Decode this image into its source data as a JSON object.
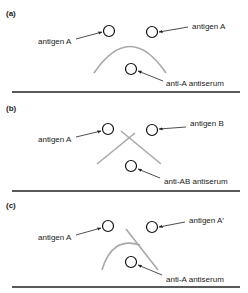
{
  "panels": [
    {
      "id": "a",
      "label": "(a)",
      "left_well": "antigen A",
      "right_well": "antigen A",
      "bottom_well": "anti-A antiserum",
      "precipitin_pattern": "continuous arc (identity)"
    },
    {
      "id": "b",
      "label": "(b)",
      "left_well": "antigen A",
      "right_well": "antigen B",
      "bottom_well": "anti-AB antiserum",
      "precipitin_pattern": "crossed lines (non-identity)"
    },
    {
      "id": "c",
      "label": "(c)",
      "left_well": "antigen A",
      "right_well": "antigen A′",
      "bottom_well": "anti-A antiserum",
      "precipitin_pattern": "arc with spur (partial identity)"
    }
  ],
  "colors": {
    "well_stroke": "#111111",
    "precipitin_line": "#a9a9a9",
    "baseline": "#222222",
    "arrow": "#222222"
  }
}
